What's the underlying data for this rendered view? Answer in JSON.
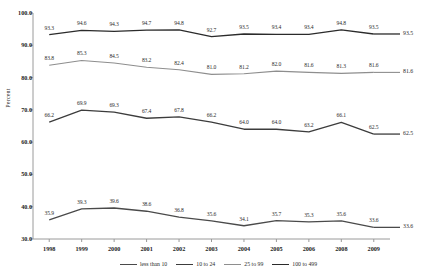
{
  "chart_data": {
    "type": "line",
    "title": "",
    "xlabel": "",
    "ylabel": "Percent",
    "ylim": [
      30.0,
      100.0
    ],
    "ytick_step": 10.0,
    "grid": false,
    "legend_position": "bottom",
    "categories": [
      "1998",
      "1999",
      "2000",
      "2001",
      "2002",
      "2003",
      "2004",
      "2005",
      "2006",
      "2008",
      "2009"
    ],
    "yticks": [
      "100.0",
      "90.0",
      "80.0",
      "70.0",
      "60.0",
      "50.0",
      "40.0",
      "30.0"
    ],
    "series": [
      {
        "name": "less than 10",
        "color": "#4a4a4a",
        "values": [
          35.9,
          39.3,
          39.6,
          38.6,
          36.8,
          35.6,
          34.1,
          35.7,
          35.3,
          35.6,
          33.6
        ],
        "labels": [
          "35.9",
          "39.3",
          "39.6",
          "38.6",
          "36.8",
          "35.6",
          "34.1",
          "35.7",
          "35.3",
          "35.6",
          "33.6"
        ],
        "end_label": "33.6"
      },
      {
        "name": "10 to 24",
        "color": "#3c3c3c",
        "values": [
          66.2,
          69.9,
          69.3,
          67.4,
          67.8,
          66.2,
          64.0,
          64.0,
          63.2,
          66.1,
          62.5
        ],
        "labels": [
          "66.2",
          "69.9",
          "69.3",
          "67.4",
          "67.8",
          "66.2",
          "64.0",
          "64.0",
          "63.2",
          "66.1",
          "62.5"
        ],
        "end_label": "62.5"
      },
      {
        "name": "25 to 99",
        "color": "#8e8e8e",
        "values": [
          83.8,
          85.3,
          84.5,
          83.2,
          82.4,
          81.0,
          81.2,
          82.0,
          81.6,
          81.3,
          81.6
        ],
        "labels": [
          "83.8",
          "85.3",
          "84.5",
          "83.2",
          "82.4",
          "81.0",
          "81.2",
          "82.0",
          "81.6",
          "81.3",
          "81.6"
        ],
        "end_label": "81.6"
      },
      {
        "name": "100 to 499",
        "color": "#2b2b2b",
        "values": [
          93.3,
          94.6,
          94.3,
          94.7,
          94.8,
          92.7,
          93.5,
          93.4,
          93.4,
          94.8,
          93.5
        ],
        "labels": [
          "93.3",
          "94.6",
          "94.3",
          "94.7",
          "94.8",
          "92.7",
          "93.5",
          "93.4",
          "93.4",
          "94.8",
          "93.5"
        ],
        "end_label": "93.5"
      }
    ]
  }
}
